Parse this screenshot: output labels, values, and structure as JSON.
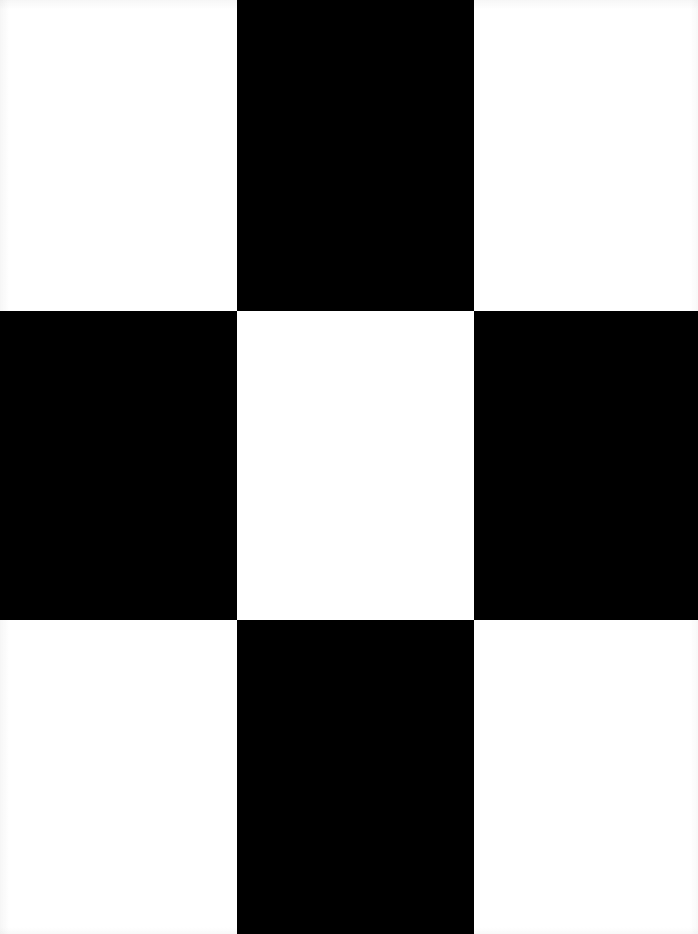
{
  "image": {
    "kind": "checkerboard-pattern",
    "description": "Three-by-three alternating black and white rectangle grid",
    "width_px": 698,
    "height_px": 934,
    "colors": {
      "light": "#ffffff",
      "dark": "#000000",
      "edge_shadow": "#969696"
    },
    "grid": {
      "columns": 3,
      "rows": 3,
      "column_widths_px": [
        237,
        237,
        224
      ],
      "row_heights_px": [
        311,
        309,
        314
      ],
      "vertical_boundaries_px": [
        0,
        237,
        474,
        698
      ],
      "horizontal_boundaries_px": [
        0,
        311,
        620,
        934
      ],
      "corner_fill": "light",
      "center_fill": "light"
    },
    "cells": [
      {
        "row": 0,
        "col": 0,
        "fill": "light",
        "x": 0,
        "y": 0,
        "w": 237,
        "h": 311
      },
      {
        "row": 0,
        "col": 1,
        "fill": "dark",
        "x": 237,
        "y": 0,
        "w": 237,
        "h": 311
      },
      {
        "row": 0,
        "col": 2,
        "fill": "light",
        "x": 474,
        "y": 0,
        "w": 224,
        "h": 311
      },
      {
        "row": 1,
        "col": 0,
        "fill": "dark",
        "x": 0,
        "y": 311,
        "w": 237,
        "h": 309
      },
      {
        "row": 1,
        "col": 1,
        "fill": "light",
        "x": 237,
        "y": 311,
        "w": 237,
        "h": 309
      },
      {
        "row": 1,
        "col": 2,
        "fill": "dark",
        "x": 474,
        "y": 311,
        "w": 224,
        "h": 309
      },
      {
        "row": 2,
        "col": 0,
        "fill": "light",
        "x": 0,
        "y": 620,
        "w": 237,
        "h": 314
      },
      {
        "row": 2,
        "col": 1,
        "fill": "dark",
        "x": 237,
        "y": 620,
        "w": 237,
        "h": 314
      },
      {
        "row": 2,
        "col": 2,
        "fill": "light",
        "x": 474,
        "y": 620,
        "w": 224,
        "h": 314
      }
    ]
  }
}
